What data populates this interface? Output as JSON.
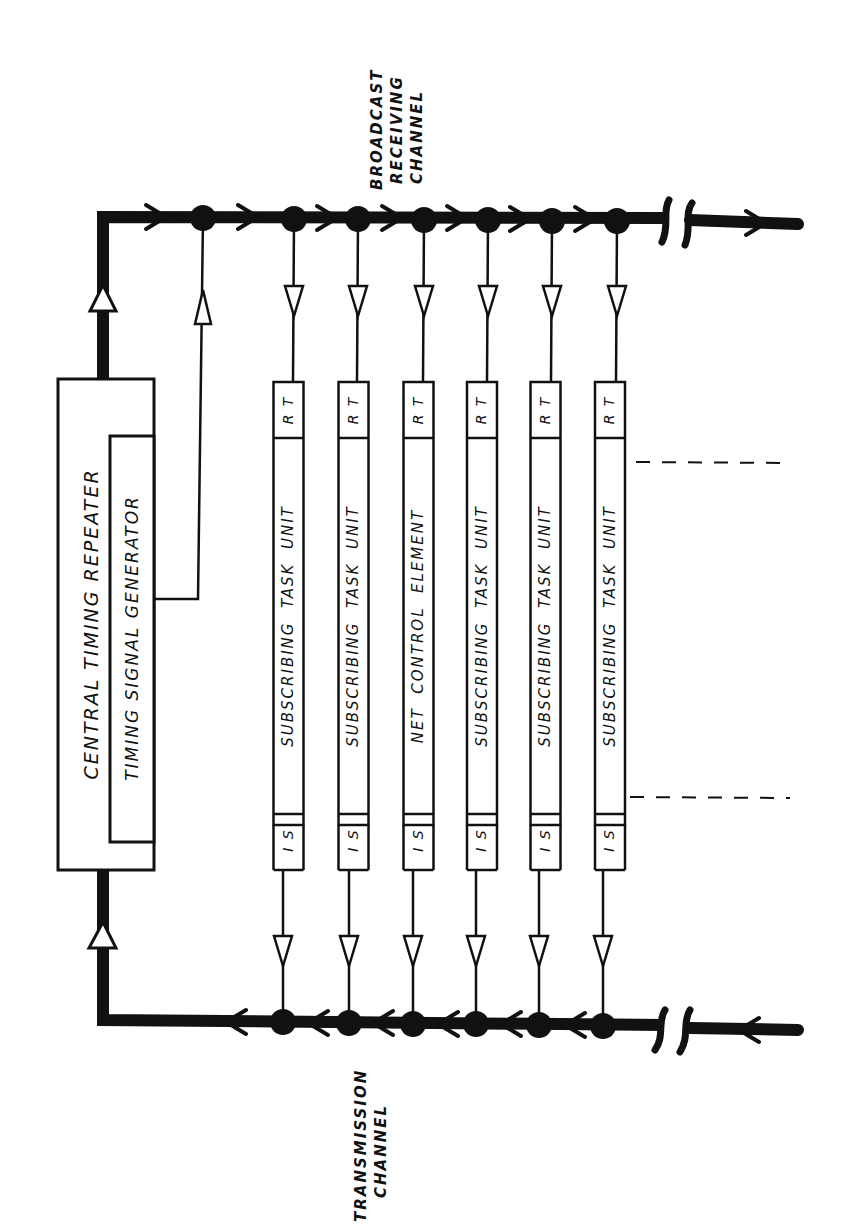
{
  "diagram": {
    "central_repeater": {
      "title": "CENTRAL TIMING REPEATER",
      "inner_label": "TIMING SIGNAL GENERATOR"
    },
    "channels": {
      "broadcast": {
        "line1": "BROADCAST",
        "line2": "RECEIVING",
        "line3": "CHANNEL"
      },
      "transmission": {
        "line1": "TRANSMISSION",
        "line2": "CHANNEL"
      }
    },
    "units": [
      {
        "top_tag": "RT",
        "label": "SUBSCRIBING TASK UNIT",
        "bottom_tag": "IS"
      },
      {
        "top_tag": "RT",
        "label": "SUBSCRIBING TASK UNIT",
        "bottom_tag": "IS"
      },
      {
        "top_tag": "RT",
        "label": "NET CONTROL ELEMENT",
        "bottom_tag": "IS"
      },
      {
        "top_tag": "RT",
        "label": "SUBSCRIBING TASK UNIT",
        "bottom_tag": "IS"
      },
      {
        "top_tag": "RT",
        "label": "SUBSCRIBING TASK UNIT",
        "bottom_tag": "IS"
      },
      {
        "top_tag": "RT",
        "label": "SUBSCRIBING TASK UNIT",
        "bottom_tag": "IS"
      }
    ],
    "colors": {
      "ink": "#111111",
      "paper": "#ffffff"
    }
  }
}
